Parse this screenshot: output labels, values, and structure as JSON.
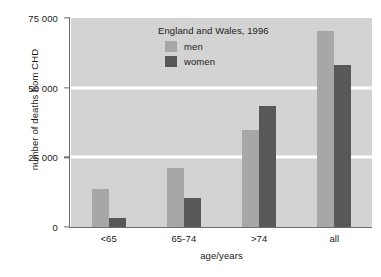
{
  "chart_data": {
    "type": "bar",
    "title": "",
    "annotation": "England and Wales, 1996",
    "xlabel": "age/years",
    "ylabel": "number of deaths from CHD",
    "categories": [
      "<65",
      "65-74",
      ">74",
      "all"
    ],
    "series": [
      {
        "name": "men",
        "color": "#a7a7a7",
        "values": [
          13500,
          21200,
          34700,
          70200
        ]
      },
      {
        "name": "women",
        "color": "#585858",
        "values": [
          3300,
          10300,
          43600,
          58200
        ]
      }
    ],
    "ylim": [
      0,
      75000
    ],
    "yticks": [
      0,
      25000,
      50000,
      75000
    ],
    "ytick_labels": [
      "0",
      "25 000",
      "50 000",
      "75 000"
    ],
    "grid": "horizontal",
    "gridlines_at": [
      25000,
      50000
    ],
    "legend_position": "inside-top-center",
    "plot_background": "#d3d3d3",
    "gridline_color": "#ffffff",
    "axis_color": "#6d6d6d"
  }
}
